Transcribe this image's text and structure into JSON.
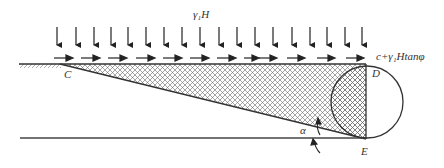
{
  "diagram": {
    "labels": {
      "vertical_load": "γ₁H",
      "shear_load": "c+γ₁Htanφ",
      "point_c": "C",
      "point_d": "D",
      "point_e": "E",
      "angle": "α"
    },
    "colors": {
      "line": "#333333",
      "hatch": "#555555",
      "background": "#ffffff"
    },
    "vertical_arrows_count": 18,
    "horizontal_arrows_count": 12
  }
}
